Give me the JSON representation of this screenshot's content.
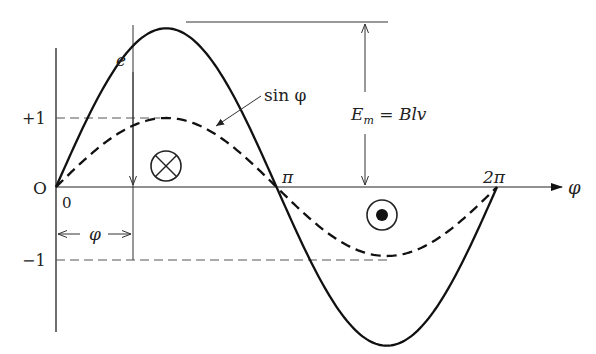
{
  "diagram": {
    "origin_label": "O",
    "zero_label": "0",
    "plus_one_label": "+1",
    "minus_one_label": "−1",
    "e_label": "e",
    "sin_label": "sin φ",
    "em_label_main": "E",
    "em_label_sub": "m",
    "em_label_rest": " = Blv",
    "pi_label": "π",
    "two_pi_label": "2π",
    "phi_axis_label": "φ",
    "phi_dim_label": "φ",
    "into_page_symbol": "cross-in-circle",
    "out_of_page_symbol": "dot-in-circle"
  },
  "chart_data": {
    "type": "line",
    "title": "",
    "xlabel": "φ",
    "ylabel": "",
    "xlim": [
      0,
      6.2832
    ],
    "x_ticks": [
      "0",
      "π",
      "2π"
    ],
    "y_ticks": [
      "+1",
      "−1"
    ],
    "series": [
      {
        "name": "e",
        "function": "Em*sin(phi)",
        "relative_amplitude": 2.3,
        "style": "solid"
      },
      {
        "name": "sin φ",
        "function": "sin(phi)",
        "relative_amplitude": 1.0,
        "style": "dashed"
      }
    ],
    "annotations": [
      "E_m = Blv",
      "φ marked between 0 and sample angle"
    ]
  }
}
